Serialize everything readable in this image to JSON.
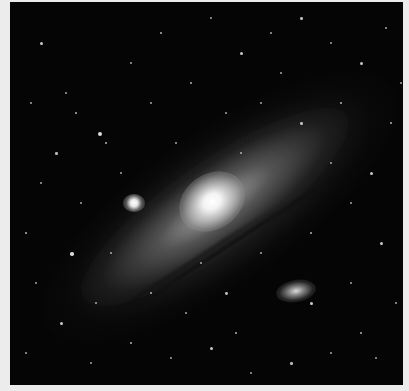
{
  "image": {
    "subject": "Andromeda galaxy (M31) with satellite galaxies M32 and M110 against a star field",
    "frame_color": "#ececec",
    "background_color": "#050505"
  },
  "features": {
    "core": "bright galactic nucleus",
    "companion_left": "M32 compact satellite galaxy",
    "companion_lower_right": "M110 elliptical satellite galaxy",
    "disk": "inclined spiral disk with dark dust lanes"
  },
  "stars": [
    [
      30,
      40,
      1.5
    ],
    [
      55,
      90,
      1
    ],
    [
      88,
      130,
      2
    ],
    [
      95,
      140,
      1.2
    ],
    [
      120,
      60,
      1
    ],
    [
      150,
      30,
      1.2
    ],
    [
      200,
      15,
      1
    ],
    [
      230,
      50,
      1.5
    ],
    [
      260,
      30,
      1
    ],
    [
      290,
      15,
      1.3
    ],
    [
      320,
      40,
      1
    ],
    [
      350,
      60,
      1.5
    ],
    [
      375,
      25,
      1
    ],
    [
      380,
      120,
      1.2
    ],
    [
      360,
      170,
      1.5
    ],
    [
      340,
      200,
      1
    ],
    [
      370,
      240,
      1.5
    ],
    [
      385,
      300,
      1
    ],
    [
      350,
      330,
      1.2
    ],
    [
      320,
      350,
      1
    ],
    [
      280,
      360,
      1.3
    ],
    [
      240,
      370,
      1
    ],
    [
      200,
      345,
      1.5
    ],
    [
      160,
      355,
      1
    ],
    [
      120,
      340,
      1.2
    ],
    [
      80,
      360,
      1
    ],
    [
      50,
      320,
      1.5
    ],
    [
      25,
      280,
      1
    ],
    [
      15,
      230,
      1.2
    ],
    [
      30,
      180,
      1
    ],
    [
      45,
      150,
      1.3
    ],
    [
      70,
      200,
      1
    ],
    [
      100,
      250,
      1
    ],
    [
      140,
      290,
      1.2
    ],
    [
      175,
      310,
      1
    ],
    [
      215,
      290,
      1.4
    ],
    [
      250,
      250,
      1
    ],
    [
      300,
      230,
      1.2
    ],
    [
      320,
      160,
      1
    ],
    [
      290,
      120,
      1.3
    ],
    [
      250,
      100,
      1
    ],
    [
      215,
      110,
      1
    ],
    [
      180,
      80,
      1.2
    ],
    [
      140,
      100,
      1
    ],
    [
      110,
      170,
      1
    ],
    [
      65,
      110,
      1.2
    ],
    [
      20,
      100,
      1
    ],
    [
      15,
      350,
      1
    ],
    [
      390,
      80,
      1
    ],
    [
      330,
      100,
      1.2
    ],
    [
      270,
      70,
      1
    ],
    [
      165,
      140,
      1
    ],
    [
      230,
      150,
      1
    ],
    [
      300,
      300,
      1.6
    ],
    [
      340,
      280,
      1
    ],
    [
      190,
      260,
      1
    ],
    [
      60,
      250,
      1.8
    ],
    [
      85,
      300,
      1
    ],
    [
      225,
      330,
      1.2
    ],
    [
      365,
      355,
      1
    ]
  ]
}
